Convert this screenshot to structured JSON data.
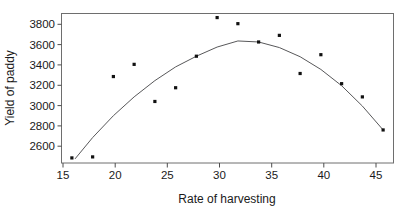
{
  "chart_data": {
    "type": "scatter",
    "title": "",
    "xlabel": "Rate of harvesting",
    "ylabel": "Yield of paddy",
    "xlim": [
      15,
      47
    ],
    "ylim": [
      2450,
      3920
    ],
    "xticks": [
      15,
      20,
      25,
      30,
      35,
      40,
      45
    ],
    "yticks": [
      2600,
      2800,
      3000,
      3200,
      3400,
      3600,
      3800
    ],
    "xtick_labels": [
      "15",
      "20",
      "25",
      "30",
      "35",
      "40",
      "45"
    ],
    "ytick_labels": [
      "2600",
      "2800",
      "3000",
      "3200",
      "3400",
      "3600",
      "3800"
    ],
    "grid": false,
    "legend": "none",
    "x": [
      16,
      18,
      20,
      22,
      24,
      26,
      28,
      30,
      32,
      34,
      36,
      38,
      40,
      42,
      44,
      46
    ],
    "y": [
      2500,
      2510,
      3300,
      3420,
      3055,
      3190,
      3500,
      3880,
      3820,
      3640,
      3705,
      3330,
      3515,
      3230,
      3100,
      2775
    ],
    "series": [
      {
        "name": "observed",
        "type": "scatter",
        "x": [
          16,
          18,
          20,
          22,
          24,
          26,
          28,
          30,
          32,
          34,
          36,
          38,
          40,
          42,
          44,
          46
        ],
        "values": [
          2500,
          2510,
          3300,
          3420,
          3055,
          3190,
          3500,
          3880,
          3820,
          3640,
          3705,
          3330,
          3515,
          3230,
          3100,
          2775
        ]
      },
      {
        "name": "fitted-quadratic-curve",
        "type": "line",
        "x": [
          16.3,
          18,
          20,
          22,
          24,
          26,
          28,
          30,
          32,
          34,
          36,
          38,
          40,
          42,
          44,
          46
        ],
        "values": [
          2490,
          2700,
          2915,
          3100,
          3260,
          3395,
          3500,
          3590,
          3650,
          3640,
          3585,
          3495,
          3370,
          3210,
          3010,
          2775
        ]
      }
    ],
    "colors": {
      "point": "#111111",
      "curve": "#58585a",
      "frame": "#6e6e6e",
      "text": "#1a1a1a",
      "background": "#ffffff"
    }
  }
}
